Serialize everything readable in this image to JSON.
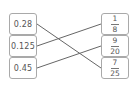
{
  "left_items": [
    {
      "label": "0.28"
    },
    {
      "label": "0.125"
    },
    {
      "label": "0.45"
    }
  ],
  "right_items": [
    {
      "numerator": "1",
      "denominator": "8"
    },
    {
      "numerator": "9",
      "denominator": "20"
    },
    {
      "numerator": "7",
      "denominator": "25"
    }
  ],
  "connections": [
    {
      "from": "0.28",
      "to": "7/25"
    },
    {
      "from": "0.125",
      "to": "1/8"
    },
    {
      "from": "0.45",
      "to": "9/20"
    }
  ],
  "colors": {
    "line": "#666666",
    "border": "#a9a9a9"
  }
}
